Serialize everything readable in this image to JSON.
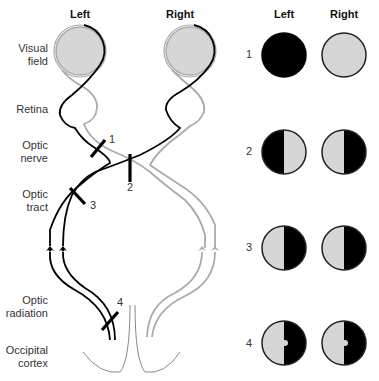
{
  "pathway": {
    "headers": {
      "left": "Left",
      "right": "Right"
    },
    "labels": [
      {
        "line1": "Visual",
        "line2": "field"
      },
      {
        "line1": "Retina",
        "line2": ""
      },
      {
        "line1": "Optic",
        "line2": "nerve"
      },
      {
        "line1": "Optic",
        "line2": "tract"
      },
      {
        "line1": "Optic",
        "line2": "radiation"
      },
      {
        "line1": "Occipital",
        "line2": "cortex"
      }
    ],
    "lesion_markers": [
      "1",
      "2",
      "3",
      "4"
    ]
  },
  "deficits": {
    "headers": {
      "left": "Left",
      "right": "Right"
    },
    "rows": [
      {
        "number": "1",
        "left": "complete blindness",
        "right": "normal"
      },
      {
        "number": "2",
        "left": "temporal hemianopia (left half lost)",
        "right": "temporal hemianopia (right half lost)"
      },
      {
        "number": "3",
        "left": "right homonymous hemianopia",
        "right": "right homonymous hemianopia"
      },
      {
        "number": "4",
        "left": "right homonymous hemianopia with macular sparing",
        "right": "right homonymous hemianopia with macular sparing"
      }
    ]
  },
  "colors": {
    "black": "#000000",
    "gray_fill": "#d6d6d6",
    "gray_line": "#aaaaaa"
  }
}
